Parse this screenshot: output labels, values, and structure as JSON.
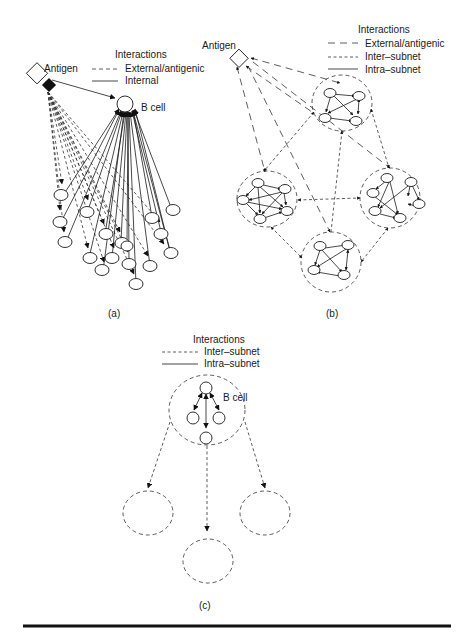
{
  "panel_a": {
    "caption": "(a)",
    "legend": {
      "title": "Interactions",
      "items": [
        {
          "style": "dashed",
          "label": "External/antigenic"
        },
        {
          "style": "solid",
          "label": "Internal"
        }
      ]
    },
    "antigen_label": "Antigen",
    "bcell_label": "B cell",
    "target_node_count": 18
  },
  "panel_b": {
    "caption": "(b)",
    "legend": {
      "title": "Interactions",
      "items": [
        {
          "style": "long-dashed",
          "label": "External/antigenic"
        },
        {
          "style": "short-dashed",
          "label": "Inter–subnet"
        },
        {
          "style": "solid",
          "label": "Intra–subnet"
        }
      ]
    },
    "antigen_label": "Antigen",
    "subnets": [
      {
        "name": "top",
        "node_count": 4
      },
      {
        "name": "left",
        "node_count": 5
      },
      {
        "name": "right",
        "node_count": 6
      },
      {
        "name": "bottom",
        "node_count": 4
      }
    ]
  },
  "panel_c": {
    "caption": "(c)",
    "legend": {
      "title": "Interactions",
      "items": [
        {
          "style": "short-dashed",
          "label": "Inter–subnet"
        },
        {
          "style": "solid",
          "label": "Intra–subnet"
        }
      ]
    },
    "bcell_label": "B cell",
    "central_subnet_node_count": 4,
    "empty_subnet_count": 3
  },
  "colors": {
    "ink": "#1a1a1a",
    "background": "#ffffff"
  }
}
